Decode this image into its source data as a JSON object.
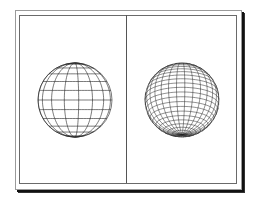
{
  "figure": {
    "panels": [
      {
        "name": "wireframe-sphere-coarse",
        "description": "Coarse wireframe sphere with latitude and longitude lines, poles converging top and bottom facing viewer",
        "latitudes": 12,
        "longitudes": 16,
        "stroke": "#222222"
      },
      {
        "name": "wireframe-sphere-fine",
        "description": "Fine wireframe sphere tilted with pole near top",
        "latitudes": 24,
        "longitudes": 28,
        "stroke": "#222222"
      }
    ],
    "colors": {
      "background": "#ffffff",
      "frame": "#6a6a6a",
      "shadow": "#111111"
    }
  }
}
